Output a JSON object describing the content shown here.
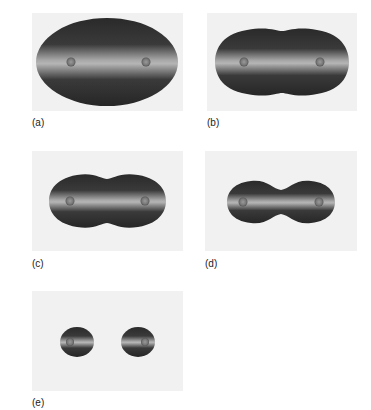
{
  "figure": {
    "panels": [
      {
        "id": "a",
        "label": "(a)",
        "shape": "ellipsoid"
      },
      {
        "id": "b",
        "label": "(b)",
        "shape": "slight-waist"
      },
      {
        "id": "c",
        "label": "(c)",
        "shape": "moderate-waist"
      },
      {
        "id": "d",
        "label": "(d)",
        "shape": "deep-waist"
      },
      {
        "id": "e",
        "label": "(e)",
        "shape": "separated"
      }
    ]
  },
  "colors": {
    "background": "#ffffff",
    "panel_background": "#f1f1f1",
    "blob_dark": "#2a2a2a",
    "blob_light": "#bdbdbd",
    "nucleus": "#7a7a7a",
    "label": "#222222"
  }
}
